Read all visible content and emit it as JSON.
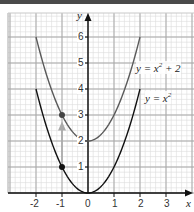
{
  "chart_data": {
    "type": "line",
    "title": "",
    "xlabel": "x",
    "ylabel": "y",
    "xlim": [
      -3.1,
      4.1
    ],
    "ylim": [
      0,
      6.9
    ],
    "grid": true,
    "grid_minor_per_unit": 5,
    "x_ticks": [
      "-2",
      "-1",
      "0",
      "1",
      "2",
      "3"
    ],
    "y_ticks": [
      "1",
      "2",
      "3",
      "4",
      "5",
      "6"
    ],
    "series": [
      {
        "name": "y = x² + 2",
        "color": "#5a5a5a",
        "x": [
          -2,
          -1.5,
          -1,
          -0.5,
          0,
          0.5,
          1,
          1.5,
          2
        ],
        "y": [
          6,
          4.25,
          3,
          2.25,
          2,
          2.25,
          3,
          4.25,
          6
        ]
      },
      {
        "name": "y = x²",
        "color": "#111111",
        "x": [
          -2,
          -1.5,
          -1,
          -0.5,
          0,
          0.5,
          1,
          1.5,
          2
        ],
        "y": [
          4,
          2.25,
          1,
          0.25,
          0,
          0.25,
          1,
          2.25,
          4
        ]
      }
    ],
    "points": [
      {
        "x": -1,
        "y": 3,
        "color": "#444444"
      },
      {
        "x": -1,
        "y": 1,
        "color": "#111111"
      }
    ],
    "annotations": [
      {
        "type": "arrow",
        "from": [
          -1,
          1.1
        ],
        "to": [
          -1,
          2.75
        ],
        "color": "#aaaaaa",
        "meaning": "vertical translation by +2"
      }
    ]
  },
  "labels": {
    "x_axis": "x",
    "y_axis": "y",
    "eq_upper_prefix": "y = x",
    "eq_upper_exp": "2",
    "eq_upper_suffix": " + 2",
    "eq_lower_prefix": "y = x",
    "eq_lower_exp": "2",
    "ticks": {
      "xm2": "-2",
      "xm1": "-1",
      "x0": "0",
      "x1": "1",
      "x2": "2",
      "x3": "3",
      "y1": "1",
      "y2": "2",
      "y3": "3",
      "y4": "4",
      "y5": "5",
      "y6": "6"
    }
  }
}
